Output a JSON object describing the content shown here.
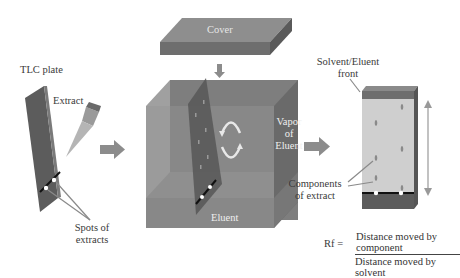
{
  "labels": {
    "tlc_plate": "TLC plate",
    "extract": "Extract",
    "spots_line1": "Spots of",
    "spots_line2": "extracts",
    "cover": "Cover",
    "vapor_line1": "Vapor",
    "vapor_line2": "of",
    "vapor_line3": "Eluent",
    "eluent": "Eluent",
    "front_line1": "Solvent/Eluent",
    "front_line2": "front",
    "components_line1": "Components",
    "components_line2": "of extract"
  },
  "formula": {
    "lhs": "Rf =",
    "numerator": "Distance moved by component",
    "denominator": "Distance moved by solvent"
  },
  "colors": {
    "plate_dark": "#5e5e5e",
    "chamber_front": "#8a8a8a",
    "chamber_side": "#6f6f6f",
    "chamber_top": "#9e9e9e",
    "eluent": "#a9a9a9",
    "developed_plate": "#cdcdcd",
    "arrow": "#8c8c8c"
  }
}
